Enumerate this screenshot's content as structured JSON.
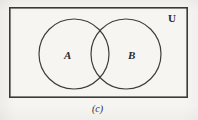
{
  "figure": {
    "type": "venn-diagram",
    "caption": "(c)",
    "background_color": "#f6f5f2",
    "stroke_color": "#3a3a3a"
  },
  "universe": {
    "label": "U",
    "rect": {
      "x": 9,
      "y": 7,
      "width": 179,
      "height": 91
    },
    "stroke_width": 1.6,
    "label_position": {
      "x": 168,
      "y": 13
    }
  },
  "sets": [
    {
      "id": "A",
      "label": "A",
      "cx": 74,
      "cy": 54,
      "r": 35,
      "stroke_width": 1.2,
      "label_position": {
        "x": 64,
        "y": 50
      }
    },
    {
      "id": "B",
      "label": "B",
      "cx": 126,
      "cy": 54,
      "r": 35,
      "stroke_width": 1.2,
      "label_position": {
        "x": 128,
        "y": 50
      }
    }
  ],
  "caption_block": {
    "text": "(c)",
    "position": {
      "x": 92,
      "y": 104
    }
  }
}
